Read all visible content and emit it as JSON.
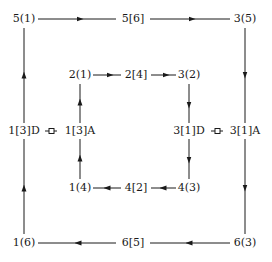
{
  "diagram": {
    "outer_loop": {
      "nodes": [
        {
          "id": "o_tl",
          "label": "5(1)",
          "x": 24,
          "y": 19
        },
        {
          "id": "o_tm",
          "label": "5[6]",
          "x": 133,
          "y": 19
        },
        {
          "id": "o_tr",
          "label": "3(5)",
          "x": 245,
          "y": 19
        },
        {
          "id": "o_ml",
          "label": "1[3]D",
          "x": 24,
          "y": 131
        },
        {
          "id": "o_mr",
          "label": "3[1]A",
          "x": 245,
          "y": 131
        },
        {
          "id": "o_bl",
          "label": "1(6)",
          "x": 24,
          "y": 243
        },
        {
          "id": "o_bm",
          "label": "6[5]",
          "x": 133,
          "y": 243
        },
        {
          "id": "o_br",
          "label": "6(3)",
          "x": 245,
          "y": 243
        }
      ],
      "direction": "clockwise"
    },
    "inner_loop": {
      "nodes": [
        {
          "id": "i_tl",
          "label": "2(1)",
          "x": 80,
          "y": 75
        },
        {
          "id": "i_tm",
          "label": "2[4]",
          "x": 136,
          "y": 75
        },
        {
          "id": "i_tr",
          "label": "3(2)",
          "x": 189,
          "y": 75
        },
        {
          "id": "i_ml",
          "label": "1[3]A",
          "x": 80,
          "y": 131
        },
        {
          "id": "i_mr",
          "label": "3[1]D",
          "x": 189,
          "y": 131
        },
        {
          "id": "i_bl",
          "label": "1(4)",
          "x": 80,
          "y": 188
        },
        {
          "id": "i_bm",
          "label": "4[2]",
          "x": 136,
          "y": 188
        },
        {
          "id": "i_br",
          "label": "4(3)",
          "x": 189,
          "y": 188
        }
      ],
      "direction": "clockwise"
    },
    "connectors": [
      {
        "from": "1[3]D",
        "to": "1[3]A",
        "x": 51,
        "y": 131,
        "icon": "square-connector-icon"
      },
      {
        "from": "3[1]D",
        "to": "3[1]A",
        "x": 217,
        "y": 131,
        "icon": "square-connector-icon"
      }
    ],
    "colors": {
      "line": "#1a1a1a",
      "background": "#ffffff"
    }
  }
}
